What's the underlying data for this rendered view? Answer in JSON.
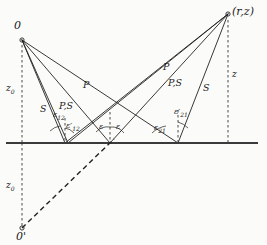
{
  "figure": {
    "kind": "seismic-ray-path-diagram",
    "background": "#fbfbf9",
    "line_color": "#222222",
    "ground_color": "#3a3a3a",
    "dash_color": "#333333"
  },
  "points": {
    "source": {
      "label": "0",
      "x": 22,
      "y": 40
    },
    "receiver": {
      "label": "(r,z)",
      "x": 228,
      "y": 14
    },
    "image_source": {
      "label": "0'",
      "x": 22,
      "y": 231
    },
    "bounce_left": {
      "x": 65,
      "y": 143
    },
    "bounce_center": {
      "x": 110,
      "y": 143
    },
    "bounce_right": {
      "x": 178,
      "y": 143
    }
  },
  "axis_labels": {
    "depth_upper": "z",
    "depth_upper_sub": "0",
    "depth_lower": "z",
    "depth_lower_sub": "0",
    "receiver_depth": "z"
  },
  "ray_labels": [
    {
      "name": "p-left",
      "text": "P",
      "x": 83,
      "y": 80
    },
    {
      "name": "ps-left",
      "text": "P,S",
      "x": 63,
      "y": 101
    },
    {
      "name": "s-left",
      "text": "S",
      "x": 42,
      "y": 104
    },
    {
      "name": "p-right",
      "text": "P",
      "x": 163,
      "y": 62
    },
    {
      "name": "ps-right",
      "text": "P,S",
      "x": 172,
      "y": 78
    },
    {
      "name": "s-right",
      "text": "S",
      "x": 203,
      "y": 83
    }
  ],
  "angle_labels": [
    {
      "name": "eps-12",
      "base": "ε",
      "sub": "12",
      "prime": false,
      "x": 56,
      "y": 110
    },
    {
      "name": "eps-12-prime",
      "base": "ε",
      "sub": "12",
      "prime": true,
      "x": 67,
      "y": 122
    },
    {
      "name": "eps-left",
      "base": "ε",
      "sub": "",
      "prime": false,
      "x": 101,
      "y": 124
    },
    {
      "name": "eps-right",
      "base": "ε",
      "sub": "",
      "prime": false,
      "x": 117,
      "y": 124
    },
    {
      "name": "eps-21",
      "base": "ε",
      "sub": "21",
      "prime": false,
      "x": 157,
      "y": 124
    },
    {
      "name": "eps-21-prime",
      "base": "ε",
      "sub": "21",
      "prime": true,
      "x": 176,
      "y": 110
    }
  ]
}
